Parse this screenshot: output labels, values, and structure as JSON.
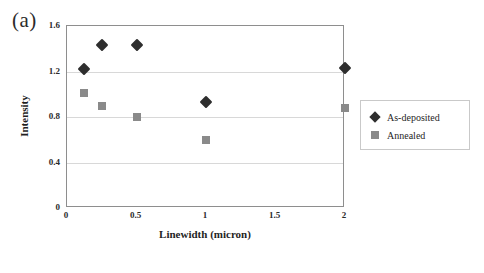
{
  "panel_label": "(a)",
  "legend": {
    "entries": [
      {
        "label": "As-deposited",
        "marker": "diamond",
        "color": "#2e2e2e"
      },
      {
        "label": "Annealed",
        "marker": "square",
        "color": "#8a8a8a"
      }
    ]
  },
  "chart_data": {
    "type": "scatter",
    "title": "",
    "xlabel": "Linewidth (micron)",
    "ylabel": "Intensity",
    "xlim": [
      0,
      2
    ],
    "ylim": [
      0,
      1.6
    ],
    "xticks": [
      "0",
      "0.5",
      "1",
      "1.5",
      "2"
    ],
    "xtick_values": [
      0,
      0.5,
      1,
      1.5,
      2
    ],
    "yticks": [
      "0",
      "0.4",
      "0.8",
      "1.2",
      "1.6"
    ],
    "ytick_values": [
      0,
      0.4,
      0.8,
      1.2,
      1.6
    ],
    "grid": "horizontal",
    "legend_position": "right-outside",
    "series": [
      {
        "name": "As-deposited",
        "marker": "diamond",
        "color": "#2e2e2e",
        "points": [
          {
            "x": 0.12,
            "y": 1.22
          },
          {
            "x": 0.25,
            "y": 1.43
          },
          {
            "x": 0.5,
            "y": 1.43
          },
          {
            "x": 1.0,
            "y": 0.93
          },
          {
            "x": 2.0,
            "y": 1.23
          }
        ]
      },
      {
        "name": "Annealed",
        "marker": "square",
        "color": "#8a8a8a",
        "points": [
          {
            "x": 0.12,
            "y": 1.01
          },
          {
            "x": 0.25,
            "y": 0.9
          },
          {
            "x": 0.5,
            "y": 0.8
          },
          {
            "x": 1.0,
            "y": 0.6
          },
          {
            "x": 2.0,
            "y": 0.88
          }
        ]
      }
    ]
  }
}
